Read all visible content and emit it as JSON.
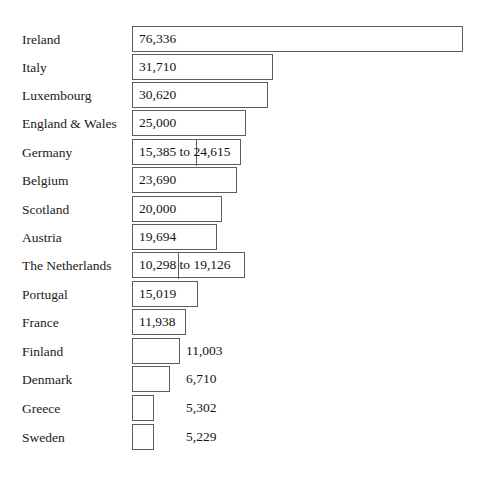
{
  "chart_data": {
    "type": "bar",
    "title": "",
    "subtitle": "",
    "xlabel": "",
    "ylabel": "",
    "orientation": "horizontal",
    "grid": false,
    "legend": null,
    "xlim": [
      0,
      76336
    ],
    "categories": [
      "Ireland",
      "Italy",
      "Luxembourg",
      "England & Wales",
      "Germany",
      "Belgium",
      "Scotland",
      "Austria",
      "The Netherlands",
      "Portugal",
      "France",
      "Finland",
      "Denmark",
      "Greece",
      "Sweden"
    ],
    "values": [
      76336,
      31710,
      30620,
      25000,
      24615,
      23690,
      20000,
      19694,
      19126,
      15019,
      11938,
      11003,
      6710,
      5302,
      5229
    ],
    "value_labels": [
      "76,336",
      "31,710",
      "30,620",
      "25,000",
      "15,385 to 24,615",
      "23,690",
      "20,000",
      "19,694",
      "10,298 to 19,126",
      "15,019",
      "11,938",
      "11,003",
      "6,710",
      "5,302",
      "5,229"
    ],
    "ranges": [
      null,
      null,
      null,
      null,
      {
        "low": 15385,
        "high": 24615
      },
      null,
      null,
      null,
      {
        "low": 10298,
        "high": 19126
      },
      null,
      null,
      null,
      null,
      null,
      null
    ],
    "label_placement": [
      "inside",
      "inside",
      "inside",
      "inside",
      "inside",
      "inside",
      "inside",
      "inside",
      "inside",
      "inside",
      "inside",
      "outside",
      "outside",
      "outside",
      "outside"
    ],
    "colors": {
      "bar_fill": "#ffffff",
      "bar_stroke": "#5d5d5d",
      "text": "#141414",
      "background": "#ffffff"
    }
  },
  "layout": {
    "rows": [
      {
        "top": 26,
        "bar_left": 132,
        "bar_right": 463,
        "divider_x": null,
        "value_x": null
      },
      {
        "top": 54,
        "bar_left": 132,
        "bar_right": 273,
        "divider_x": null,
        "value_x": null
      },
      {
        "top": 82,
        "bar_left": 132,
        "bar_right": 268,
        "divider_x": null,
        "value_x": null
      },
      {
        "top": 110,
        "bar_left": 132,
        "bar_right": 246,
        "divider_x": null,
        "value_x": null
      },
      {
        "top": 139,
        "bar_left": 132,
        "bar_right": 241,
        "divider_x": 196,
        "value_x": null
      },
      {
        "top": 167,
        "bar_left": 132,
        "bar_right": 237,
        "divider_x": null,
        "value_x": null
      },
      {
        "top": 196,
        "bar_left": 132,
        "bar_right": 222,
        "divider_x": null,
        "value_x": null
      },
      {
        "top": 224,
        "bar_left": 132,
        "bar_right": 217,
        "divider_x": null,
        "value_x": null
      },
      {
        "top": 252,
        "bar_left": 132,
        "bar_right": 245,
        "divider_x": 178,
        "value_x": null
      },
      {
        "top": 281,
        "bar_left": 132,
        "bar_right": 198,
        "divider_x": null,
        "value_x": null
      },
      {
        "top": 309,
        "bar_left": 132,
        "bar_right": 186,
        "divider_x": null,
        "value_x": null
      },
      {
        "top": 338,
        "bar_left": 132,
        "bar_right": 180,
        "divider_x": null,
        "value_x": 186
      },
      {
        "top": 366,
        "bar_left": 132,
        "bar_right": 170,
        "divider_x": null,
        "value_x": 186
      },
      {
        "top": 395,
        "bar_left": 132,
        "bar_right": 154,
        "divider_x": null,
        "value_x": 186
      },
      {
        "top": 424,
        "bar_left": 132,
        "bar_right": 154,
        "divider_x": null,
        "value_x": 186
      }
    ]
  }
}
